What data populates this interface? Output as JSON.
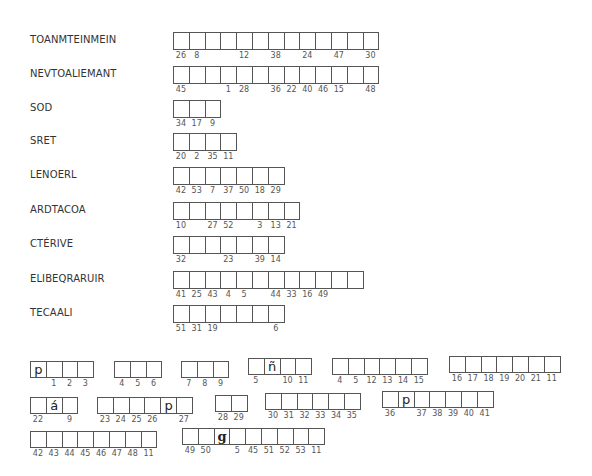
{
  "words": [
    {
      "label": "TOANMTEINMEIN",
      "top": 32,
      "boxes": 13,
      "numbers": [
        "26",
        "8",
        "",
        "",
        "12",
        "",
        "38",
        "",
        "24",
        "",
        "47",
        "",
        "30"
      ]
    },
    {
      "label": "NEVTOALIEMANT",
      "top": 66,
      "boxes": 13,
      "numbers": [
        "45",
        "",
        "",
        "1",
        "28",
        "",
        "36",
        "22",
        "40",
        "46",
        "15",
        "",
        "48"
      ]
    },
    {
      "label": "SOD",
      "top": 100,
      "boxes": 3,
      "numbers": [
        "34",
        "17",
        "9"
      ]
    },
    {
      "label": "SRET",
      "top": 133,
      "boxes": 4,
      "numbers": [
        "20",
        "2",
        "35",
        "11"
      ]
    },
    {
      "label": "LENOERL",
      "top": 167,
      "boxes": 7,
      "numbers": [
        "42",
        "53",
        "7",
        "37",
        "50",
        "18",
        "29"
      ]
    },
    {
      "label": "ARDTACOA",
      "top": 202,
      "boxes": 8,
      "numbers": [
        "10",
        "",
        "27",
        "52",
        "",
        "3",
        "13",
        "21"
      ]
    },
    {
      "label": "CTÉRIVE",
      "top": 236,
      "boxes": 7,
      "numbers": [
        "32",
        "",
        "",
        "23",
        "",
        "39",
        "14"
      ]
    },
    {
      "label": "ELIBEQRARUIR",
      "top": 271,
      "boxes": 12,
      "numbers": [
        "41",
        "25",
        "43",
        "4",
        "5",
        "",
        "44",
        "33",
        "16",
        "49",
        "",
        ""
      ]
    },
    {
      "label": "TECAALI",
      "top": 305,
      "boxes": 7,
      "numbers": [
        "51",
        "31",
        "19",
        "",
        "",
        "",
        "6"
      ]
    }
  ],
  "phrase_groups": [
    {
      "left": 30,
      "top": 361,
      "letters": [
        "p",
        "",
        "",
        ""
      ],
      "numbers": [
        "",
        "1",
        "2",
        "3"
      ]
    },
    {
      "left": 114,
      "top": 361,
      "letters": [
        "",
        "",
        ""
      ],
      "numbers": [
        "4",
        "5",
        "6"
      ]
    },
    {
      "left": 181,
      "top": 361,
      "letters": [
        "",
        "",
        ""
      ],
      "numbers": [
        "7",
        "8",
        "9"
      ]
    },
    {
      "left": 248,
      "top": 358,
      "letters": [
        "",
        "ñ",
        "",
        ""
      ],
      "numbers": [
        "5",
        "",
        "10",
        "11"
      ]
    },
    {
      "left": 332,
      "top": 358,
      "letters": [
        "",
        "",
        "",
        "",
        "",
        ""
      ],
      "numbers": [
        "4",
        "5",
        "12",
        "13",
        "14",
        "15"
      ]
    },
    {
      "left": 449,
      "top": 356,
      "letters": [
        "",
        "",
        "",
        "",
        "",
        "",
        ""
      ],
      "numbers": [
        "16",
        "17",
        "18",
        "19",
        "20",
        "21",
        "11"
      ]
    },
    {
      "left": 30,
      "top": 397,
      "letters": [
        "",
        "á",
        ""
      ],
      "numbers": [
        "22",
        "",
        "9"
      ]
    },
    {
      "left": 97,
      "top": 397,
      "letters": [
        "",
        "",
        "",
        "",
        "p",
        ""
      ],
      "numbers": [
        "23",
        "24",
        "25",
        "26",
        "",
        "27"
      ]
    },
    {
      "left": 215,
      "top": 395,
      "letters": [
        "",
        ""
      ],
      "numbers": [
        "28",
        "29"
      ]
    },
    {
      "left": 265,
      "top": 393,
      "letters": [
        "",
        "",
        "",
        "",
        "",
        ""
      ],
      "numbers": [
        "30",
        "31",
        "32",
        "33",
        "34",
        "35"
      ]
    },
    {
      "left": 382,
      "top": 391,
      "letters": [
        "",
        "p",
        "",
        "",
        "",
        "",
        ""
      ],
      "numbers": [
        "36",
        "",
        "37",
        "38",
        "39",
        "40",
        "41"
      ]
    },
    {
      "left": 30,
      "top": 431,
      "letters": [
        "",
        "",
        "",
        "",
        "",
        "",
        "",
        ""
      ],
      "numbers": [
        "42",
        "43",
        "44",
        "45",
        "46",
        "47",
        "48",
        "11"
      ]
    },
    {
      "left": 182,
      "top": 428,
      "letters": [
        "",
        "",
        "g",
        "",
        "",
        "",
        "",
        "",
        ""
      ],
      "numbers": [
        "49",
        "50",
        "",
        "5",
        "45",
        "51",
        "52",
        "53",
        "11"
      ]
    }
  ]
}
